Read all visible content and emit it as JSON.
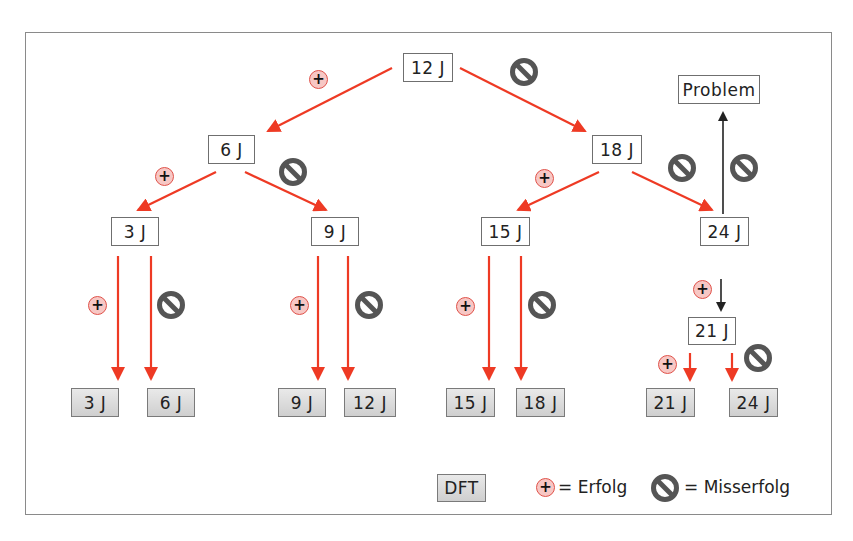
{
  "diagram": {
    "type": "decision-tree",
    "colors": {
      "arrow_red": "#ee3a24",
      "arrow_black": "#222222",
      "plus_fill": "#f7c7c4",
      "plus_border": "#e0524a",
      "nogo_gray": "#555555",
      "frame_border": "#8a8a8a"
    },
    "nodes": {
      "root": "12 J",
      "n6": "6 J",
      "n18": "18 J",
      "n3": "3 J",
      "n9": "9 J",
      "n15": "15 J",
      "n24": "24 J",
      "problem": "Problem",
      "n21": "21 J"
    },
    "leaves": [
      {
        "label": "3 J"
      },
      {
        "label": "6 J"
      },
      {
        "label": "9 J"
      },
      {
        "label": "12 J"
      },
      {
        "label": "15 J"
      },
      {
        "label": "18 J"
      },
      {
        "label": "21 J"
      },
      {
        "label": "24 J"
      }
    ],
    "symbols": {
      "success": "+",
      "failure": "prohibition-icon"
    },
    "edges": [
      {
        "from": "12 J",
        "to": "6 J",
        "outcome": "Erfolg"
      },
      {
        "from": "12 J",
        "to": "18 J",
        "outcome": "Misserfolg"
      },
      {
        "from": "6 J",
        "to": "3 J",
        "outcome": "Erfolg"
      },
      {
        "from": "6 J",
        "to": "9 J",
        "outcome": "Misserfolg"
      },
      {
        "from": "18 J",
        "to": "15 J",
        "outcome": "Erfolg"
      },
      {
        "from": "18 J",
        "to": "24 J",
        "outcome": "Misserfolg"
      },
      {
        "from": "24 J",
        "to": "Problem",
        "outcome": "Misserfolg"
      },
      {
        "from": "24 J",
        "to": "21 J",
        "outcome": "Erfolg"
      },
      {
        "from": "3 J",
        "to": "3 J (DFT)",
        "outcome": "Erfolg"
      },
      {
        "from": "3 J",
        "to": "6 J (DFT)",
        "outcome": "Misserfolg"
      },
      {
        "from": "9 J",
        "to": "9 J (DFT)",
        "outcome": "Erfolg"
      },
      {
        "from": "9 J",
        "to": "12 J (DFT)",
        "outcome": "Misserfolg"
      },
      {
        "from": "15 J",
        "to": "15 J (DFT)",
        "outcome": "Erfolg"
      },
      {
        "from": "15 J",
        "to": "18 J (DFT)",
        "outcome": "Misserfolg"
      },
      {
        "from": "21 J",
        "to": "21 J (DFT)",
        "outcome": "Erfolg"
      },
      {
        "from": "21 J",
        "to": "24 J (DFT)",
        "outcome": "Misserfolg"
      }
    ]
  },
  "legend": {
    "dft_label": "DFT",
    "success_symbol": "+",
    "success_text": "= Erfolg",
    "failure_text": "= Misserfolg"
  }
}
